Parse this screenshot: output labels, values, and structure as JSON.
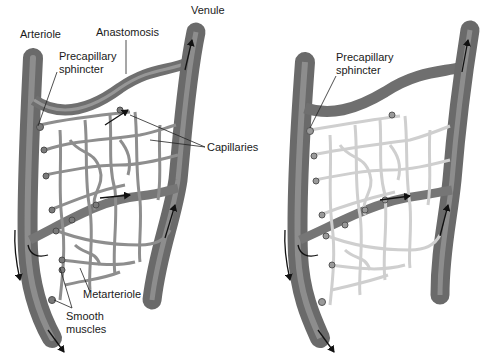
{
  "panels": [
    {
      "id": "left",
      "state": "capillaries-perfused",
      "labels": {
        "arteriole": "Arteriole",
        "anastomosis": "Anastomosis",
        "venule": "Venule",
        "precapillary_sphincter_line1": "Precapillary",
        "precapillary_sphincter_line2": "sphincter",
        "capillaries": "Capillaries",
        "metarteriole": "Metarteriole",
        "smooth_muscles_line1": "Smooth",
        "smooth_muscles_line2": "muscles"
      }
    },
    {
      "id": "right",
      "state": "capillaries-bypassed",
      "labels": {
        "precapillary_sphincter_line1": "Precapillary",
        "precapillary_sphincter_line2": "sphincter"
      }
    }
  ],
  "colors": {
    "vessel_dark": "#6e6e6e",
    "vessel_mid": "#8c8c8c",
    "vessel_light": "#b0b0b0",
    "capillary_filled": "#9a9a9a",
    "capillary_empty": "#e2e2e2",
    "arrow": "#111111",
    "text": "#1a1a1a"
  }
}
